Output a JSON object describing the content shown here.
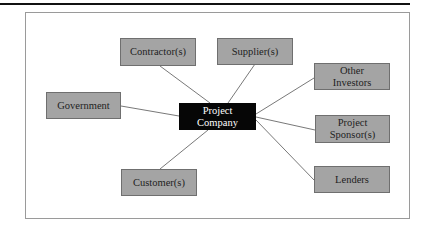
{
  "diagram": {
    "type": "hub-and-spoke",
    "center": {
      "id": "project-company",
      "label_line1": "Project",
      "label_line2": "Company"
    },
    "nodes": [
      {
        "id": "contractors",
        "label": "Contractor(s)"
      },
      {
        "id": "suppliers",
        "label": "Supplier(s)"
      },
      {
        "id": "government",
        "label": "Government"
      },
      {
        "id": "other-investors",
        "label_line1": "Other",
        "label_line2": "Investors"
      },
      {
        "id": "project-sponsors",
        "label_line1": "Project",
        "label_line2": "Sponsor(s)"
      },
      {
        "id": "customers",
        "label": "Customer(s)"
      },
      {
        "id": "lenders",
        "label": "Lenders"
      }
    ],
    "edges": [
      [
        "project-company",
        "contractors"
      ],
      [
        "project-company",
        "suppliers"
      ],
      [
        "project-company",
        "government"
      ],
      [
        "project-company",
        "other-investors"
      ],
      [
        "project-company",
        "project-sponsors"
      ],
      [
        "project-company",
        "customers"
      ],
      [
        "project-company",
        "lenders"
      ]
    ],
    "colors": {
      "node_fill": "#a4a4a4",
      "center_fill": "#060606",
      "center_text": "#ffffff",
      "line": "#555555"
    }
  }
}
